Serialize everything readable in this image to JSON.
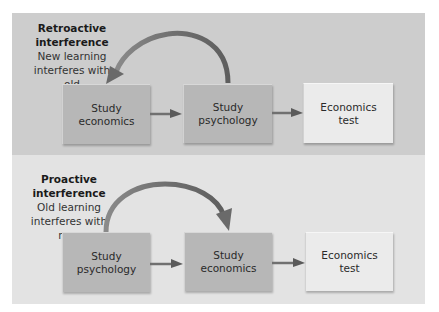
{
  "panels": [
    {
      "id": "retroactive",
      "title": "Retroactive\ninterference",
      "description": "New learning\ninterferes with old",
      "boxes": [
        {
          "label": "Study\neconomics",
          "style": "dark"
        },
        {
          "label": "Study\npsychology",
          "style": "dark"
        },
        {
          "label": "Economics\ntest",
          "style": "light"
        }
      ],
      "curved_arrow": "from box 2 back to box 1"
    },
    {
      "id": "proactive",
      "title": "Proactive\ninterference",
      "description": "Old learning\ninterferes with new",
      "boxes": [
        {
          "label": "Study\npsychology",
          "style": "dark"
        },
        {
          "label": "Study\neconomics",
          "style": "dark"
        },
        {
          "label": "Economics\ntest",
          "style": "light"
        }
      ],
      "curved_arrow": "from box 1 forward to box 2"
    }
  ],
  "colors": {
    "top_panel_bg": "#cdcdcd",
    "bottom_panel_bg": "#e3e3e3",
    "dark_box": "#b7b7b7",
    "light_box": "#ebebeb",
    "arrow": "#6a6a6a"
  }
}
